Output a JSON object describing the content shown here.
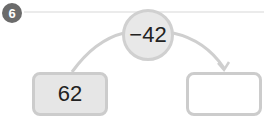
{
  "problem_number": "6",
  "operation": "−42",
  "start_value": "62",
  "answer_value": "",
  "colors": {
    "badge": "#6b6b6b",
    "circle_fill": "#e8e8e8",
    "border": "#cccccc",
    "box_fill": "#e6e6e6"
  }
}
